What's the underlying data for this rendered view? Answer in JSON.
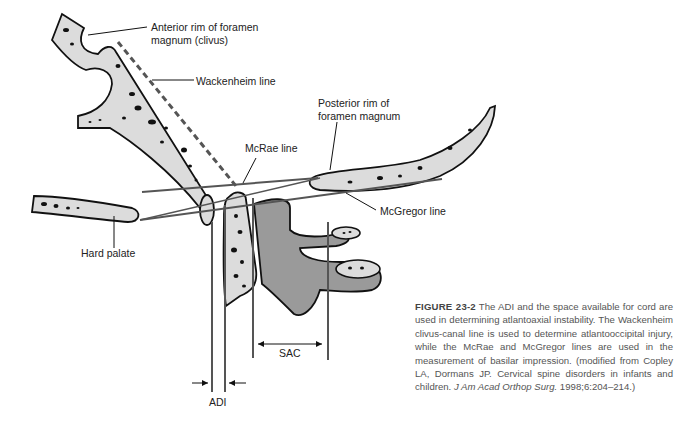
{
  "figure": {
    "labels": {
      "anterior_rim_line1": "Anterior rim of foramen",
      "anterior_rim_line2": "magnum (clivus)",
      "wackenheim": "Wackenheim line",
      "posterior_rim_line1": "Posterior rim of",
      "posterior_rim_line2": "foramen magnum",
      "mcrae": "McRae line",
      "mcgregor": "McGregor line",
      "hard_palate": "Hard palate",
      "sac": "SAC",
      "adi": "ADI"
    },
    "colors": {
      "bone_fill": "#dcdcdc",
      "vertebra_fill": "#9a9a9a",
      "line": "#555555",
      "outline": "#111111"
    }
  },
  "caption": {
    "figure_number": "FIGURE 23-2",
    "text": " The ADI and the space available for cord are used in determining atlantoaxial instability. The Wackenheim clivus-canal line is used to determine atlantooccipital injury, while the McRae and McGregor lines are used in the measurement of basilar impression. (modified from Copley LA, Dormans JP. Cervical spine disorders in infants and children. ",
    "journal": "J Am Acad Orthop Surg.",
    "citation_tail": " 1998;6:204–214.)"
  }
}
